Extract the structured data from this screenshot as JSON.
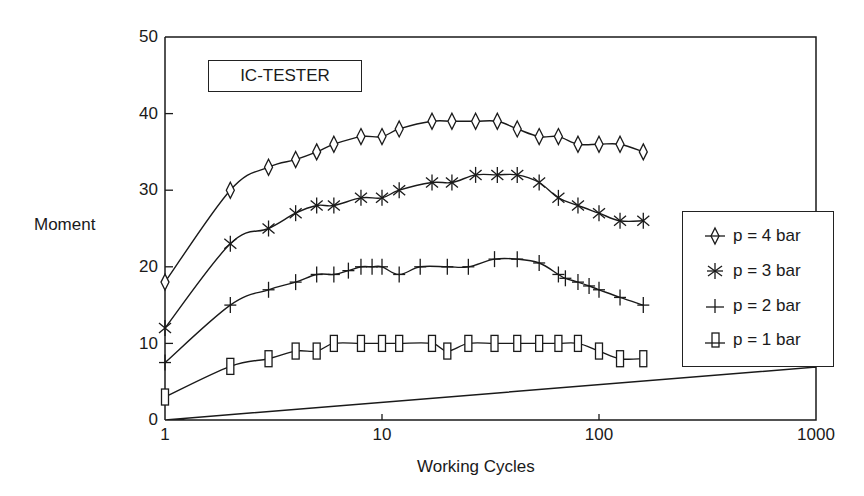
{
  "chart_data": {
    "type": "line",
    "title": "IC-TESTER",
    "xlabel": "Working Cycles",
    "ylabel": "Moment",
    "xscale": "log",
    "xlim": [
      1,
      1000
    ],
    "ylim": [
      0,
      50
    ],
    "xticks": [
      "1",
      "10",
      "100",
      "1000"
    ],
    "yticks": [
      "0",
      "10",
      "20",
      "30",
      "40",
      "50"
    ],
    "grid": false,
    "legend_position": "right",
    "series": [
      {
        "name": "p = 4 bar",
        "marker": "diamond",
        "x": [
          1,
          2,
          3,
          4,
          5,
          6,
          8,
          10,
          12,
          17,
          21,
          27,
          34,
          42,
          53,
          65,
          80,
          100,
          125,
          160
        ],
        "y": [
          18,
          30,
          33,
          34,
          35,
          36,
          37,
          37,
          38,
          39,
          39,
          39,
          39,
          38,
          37,
          37,
          36,
          36,
          36,
          35
        ]
      },
      {
        "name": "p = 3 bar",
        "marker": "asterisk",
        "x": [
          1,
          2,
          3,
          4,
          5,
          6,
          8,
          10,
          12,
          17,
          21,
          27,
          34,
          42,
          53,
          65,
          80,
          100,
          125,
          160
        ],
        "y": [
          12,
          23,
          25,
          27,
          28,
          28,
          29,
          29,
          30,
          31,
          31,
          32,
          32,
          32,
          31,
          29,
          28,
          27,
          26,
          26
        ]
      },
      {
        "name": "p = 2 bar",
        "marker": "plus",
        "x": [
          1,
          2,
          3,
          4,
          5,
          6,
          7,
          8,
          9,
          10,
          12,
          15,
          20,
          25,
          33,
          42,
          53,
          65,
          70,
          80,
          90,
          100,
          125,
          160
        ],
        "y": [
          7.5,
          15,
          17,
          18,
          19,
          19,
          19.5,
          20,
          20,
          20,
          19,
          20,
          20,
          20,
          21,
          21,
          20.5,
          19,
          18.5,
          18,
          17.5,
          17,
          16,
          15
        ]
      },
      {
        "name": "p = 1 bar",
        "marker": "square",
        "x": [
          1,
          2,
          3,
          4,
          5,
          6,
          8,
          10,
          12,
          17,
          20,
          25,
          33,
          42,
          53,
          65,
          80,
          100,
          125,
          160
        ],
        "y": [
          3,
          7,
          8,
          9,
          9,
          10,
          10,
          10,
          10,
          10,
          9,
          10,
          10,
          10,
          10,
          10,
          10,
          9,
          8,
          8
        ]
      }
    ]
  },
  "labels": {
    "title": "IC-TESTER",
    "xlabel": "Working Cycles",
    "ylabel": "Moment",
    "legend": [
      "p = 4 bar",
      "p = 3 bar",
      "p = 2 bar",
      "p = 1 bar"
    ],
    "yticks": [
      "0",
      "10",
      "20",
      "30",
      "40",
      "50"
    ],
    "xticks": [
      "1",
      "10",
      "100",
      "1000"
    ]
  },
  "colors": {
    "ink": "#1a1a1a",
    "background": "#ffffff"
  }
}
